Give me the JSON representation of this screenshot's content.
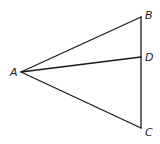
{
  "diagram": {
    "type": "geometry-triangle",
    "points": {
      "A": {
        "label": "A",
        "x": 21,
        "y": 72,
        "label_x": 10,
        "label_y": 76
      },
      "B": {
        "label": "B",
        "x": 141,
        "y": 17,
        "label_x": 145,
        "label_y": 19
      },
      "D": {
        "label": "D",
        "x": 141,
        "y": 57,
        "label_x": 145,
        "label_y": 61
      },
      "C": {
        "label": "C",
        "x": 141,
        "y": 128,
        "label_x": 145,
        "label_y": 136
      }
    },
    "segments": [
      {
        "from": "A",
        "to": "B"
      },
      {
        "from": "A",
        "to": "D"
      },
      {
        "from": "A",
        "to": "C"
      },
      {
        "from": "B",
        "to": "C"
      }
    ],
    "line_color": "#1a1a1a",
    "background": "#ffffff"
  }
}
